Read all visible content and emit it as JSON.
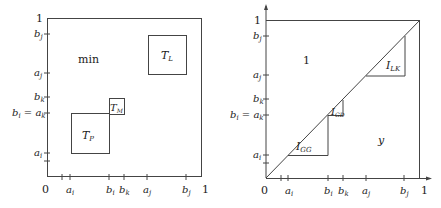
{
  "left_panel": {
    "corner_top_label": "1",
    "origin_label": "0",
    "x_right_label": "1",
    "x_ticks": [
      {
        "label": "",
        "x": 62
      },
      {
        "label": "a",
        "sub": "i",
        "x": 70
      },
      {
        "label": "b",
        "sub": "i",
        "x": 109
      },
      {
        "label": "b",
        "sub": "k",
        "x": 124
      },
      {
        "label": "a",
        "sub": "j",
        "x": 147
      },
      {
        "label": "b",
        "sub": "j",
        "x": 186
      }
    ],
    "y_ticks": [
      {
        "label": "b",
        "sub": "j",
        "y": 34
      },
      {
        "label": "a",
        "sub": "j",
        "y": 73
      },
      {
        "label": "b",
        "sub": "k",
        "y": 97
      },
      {
        "label": "b",
        "sub": "i",
        "extra": " = a",
        "extra_sub": "k",
        "y": 113
      },
      {
        "label": "a",
        "sub": "i",
        "y": 153
      },
      {
        "label": "",
        "y": 161
      }
    ],
    "region_label": "min",
    "boxes": [
      {
        "name": "T",
        "sub": "L"
      },
      {
        "name": "T",
        "sub": "M"
      },
      {
        "name": "T",
        "sub": "P"
      }
    ]
  },
  "right_panel": {
    "corner_top_label": "1",
    "origin_label": "0",
    "x_right_label": "1",
    "x_ticks": [
      {
        "label": "",
        "x": 281
      },
      {
        "label": "a",
        "sub": "i",
        "x": 288
      },
      {
        "label": "b",
        "sub": "i",
        "x": 328
      },
      {
        "label": "b",
        "sub": "k",
        "x": 343
      },
      {
        "label": "a",
        "sub": "j",
        "x": 366
      },
      {
        "label": "b",
        "sub": "j",
        "x": 404
      }
    ],
    "y_ticks": [
      {
        "label": "b",
        "sub": "j",
        "y": 36
      },
      {
        "label": "a",
        "sub": "j",
        "y": 75
      },
      {
        "label": "b",
        "sub": "k",
        "y": 99
      },
      {
        "label": "b",
        "sub": "i",
        "extra": " = a",
        "extra_sub": "k",
        "y": 115
      },
      {
        "label": "a",
        "sub": "i",
        "y": 155
      },
      {
        "label": "",
        "y": 163
      }
    ],
    "upper_region_label": "1",
    "lower_region_label": "y",
    "triangles": [
      {
        "name": "I",
        "sub": "LK"
      },
      {
        "name": "I",
        "sub": "GD"
      },
      {
        "name": "I",
        "sub": "GG"
      }
    ]
  }
}
